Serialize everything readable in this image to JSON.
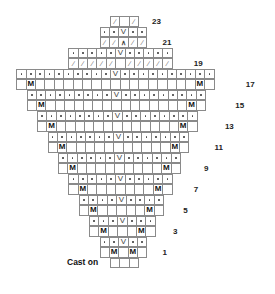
{
  "chart": {
    "type": "knitting-chart",
    "cast_on_label": "Cast on",
    "cell_legend": {
      "dot": "purl",
      "blank": "knit",
      "M": "make one",
      "V": "slip / increase",
      "/": "decrease",
      "^": "double decrease"
    },
    "rows": [
      {
        "row": 23,
        "label": "23",
        "cells": [
          "/",
          "",
          "/"
        ]
      },
      {
        "row": 22,
        "label": "",
        "cells": [
          "•",
          "•",
          "V",
          "•",
          "•"
        ]
      },
      {
        "row": 21,
        "label": "21",
        "cells": [
          "/",
          "/",
          "^",
          "/",
          "/"
        ]
      },
      {
        "row": 20,
        "label": "",
        "cells": [
          "•",
          "•",
          "•",
          "•",
          "•",
          "V",
          "•",
          "•",
          "•",
          "•",
          "•"
        ]
      },
      {
        "row": 19,
        "label": "19",
        "cells": [
          "/",
          "/",
          "/",
          "/",
          "/",
          "",
          "/",
          "/",
          "/",
          "/",
          "/"
        ]
      },
      {
        "row": 18,
        "label": "",
        "cells": [
          "•",
          "•",
          "•",
          "•",
          "•",
          "•",
          "•",
          "•",
          "•",
          "•",
          "V",
          "•",
          "•",
          "•",
          "•",
          "•",
          "•",
          "•",
          "•",
          "•",
          "•"
        ]
      },
      {
        "row": 17,
        "label": "17",
        "cells": [
          "",
          "M",
          "",
          "",
          "",
          "",
          "",
          "",
          "",
          "",
          "",
          "",
          "",
          "",
          "",
          "",
          "",
          "",
          "",
          "M",
          ""
        ]
      },
      {
        "row": 16,
        "label": "",
        "cells": [
          "•",
          "•",
          "•",
          "•",
          "•",
          "•",
          "•",
          "•",
          "•",
          "V",
          "•",
          "•",
          "•",
          "•",
          "•",
          "•",
          "•",
          "•",
          "•"
        ]
      },
      {
        "row": 15,
        "label": "15",
        "cells": [
          "",
          "M",
          "",
          "",
          "",
          "",
          "",
          "",
          "",
          "",
          "",
          "",
          "",
          "",
          "",
          "",
          "",
          "M",
          ""
        ]
      },
      {
        "row": 14,
        "label": "",
        "cells": [
          "•",
          "•",
          "•",
          "•",
          "•",
          "•",
          "•",
          "•",
          "V",
          "•",
          "•",
          "•",
          "•",
          "•",
          "•",
          "•",
          "•"
        ]
      },
      {
        "row": 13,
        "label": "13",
        "cells": [
          "",
          "M",
          "",
          "",
          "",
          "",
          "",
          "",
          "",
          "",
          "",
          "",
          "",
          "",
          "",
          "M",
          ""
        ]
      },
      {
        "row": 12,
        "label": "",
        "cells": [
          "•",
          "•",
          "•",
          "•",
          "•",
          "•",
          "•",
          "V",
          "•",
          "•",
          "•",
          "•",
          "•",
          "•",
          "•"
        ]
      },
      {
        "row": 11,
        "label": "11",
        "cells": [
          "",
          "M",
          "",
          "",
          "",
          "",
          "",
          "",
          "",
          "",
          "",
          "",
          "",
          "M",
          ""
        ]
      },
      {
        "row": 10,
        "label": "",
        "cells": [
          "•",
          "•",
          "•",
          "•",
          "•",
          "•",
          "V",
          "•",
          "•",
          "•",
          "•",
          "•",
          "•"
        ]
      },
      {
        "row": 9,
        "label": "9",
        "cells": [
          "",
          "M",
          "",
          "",
          "",
          "",
          "",
          "",
          "",
          "",
          "",
          "M",
          ""
        ]
      },
      {
        "row": 8,
        "label": "",
        "cells": [
          "•",
          "•",
          "•",
          "•",
          "•",
          "V",
          "•",
          "•",
          "•",
          "•",
          "•"
        ]
      },
      {
        "row": 7,
        "label": "7",
        "cells": [
          "",
          "M",
          "",
          "",
          "",
          "",
          "",
          "",
          "",
          "M",
          ""
        ]
      },
      {
        "row": 6,
        "label": "",
        "cells": [
          "•",
          "•",
          "•",
          "•",
          "V",
          "•",
          "•",
          "•",
          "•"
        ]
      },
      {
        "row": 5,
        "label": "5",
        "cells": [
          "",
          "M",
          "",
          "",
          "",
          "",
          "",
          "M",
          ""
        ]
      },
      {
        "row": 4,
        "label": "",
        "cells": [
          "•",
          "•",
          "•",
          "V",
          "•",
          "•",
          "•"
        ]
      },
      {
        "row": 3,
        "label": "3",
        "cells": [
          "",
          "M",
          "",
          "",
          "",
          "M",
          ""
        ]
      },
      {
        "row": 2,
        "label": "",
        "cells": [
          "•",
          "•",
          "V",
          "•",
          "•"
        ]
      },
      {
        "row": 1,
        "label": "1",
        "cells": [
          "",
          "M",
          "",
          "M",
          ""
        ]
      },
      {
        "row": 0,
        "label": "",
        "cells": [
          "",
          "",
          ""
        ]
      }
    ]
  }
}
